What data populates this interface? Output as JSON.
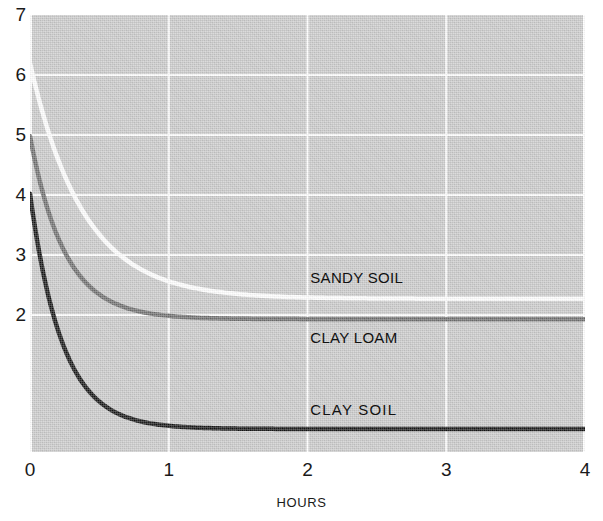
{
  "chart_data": {
    "type": "line",
    "title": "",
    "xlabel": "HOURS",
    "ylabel": "",
    "xlim": [
      0,
      4
    ],
    "ylim": [
      0,
      7
    ],
    "xticks": [
      "0",
      "1",
      "2",
      "3",
      "4"
    ],
    "yticks": [
      "7",
      "6",
      "5",
      "4",
      "3",
      "2"
    ],
    "grid": true,
    "grid_color": "#ffffff",
    "plot_background": "#c9c9c9",
    "legend_position": "inline-right-of-curves",
    "series": [
      {
        "name": "SANDY SOIL",
        "color": "#ffffff",
        "start_value": 6.2,
        "asymptote": 2.27,
        "decay_rate": 2.6,
        "label_x": 2.02,
        "label_y": 2.62,
        "x": [
          0.0,
          0.1,
          0.2,
          0.3,
          0.4,
          0.5,
          0.6,
          0.7,
          0.8,
          0.9,
          1.0,
          1.2,
          1.4,
          1.6,
          1.8,
          2.0,
          2.5,
          3.0,
          3.5,
          4.0
        ],
        "values": [
          6.2,
          5.27,
          4.55,
          3.99,
          3.56,
          3.23,
          2.97,
          2.78,
          2.63,
          2.51,
          2.42,
          2.33,
          2.29,
          2.28,
          2.27,
          2.27,
          2.27,
          2.27,
          2.27,
          2.27
        ]
      },
      {
        "name": "CLAY LOAM",
        "color": "#6d6d6d",
        "start_value": 4.98,
        "asymptote": 1.93,
        "decay_rate": 4.0,
        "label_x": 2.02,
        "label_y": 1.62,
        "x": [
          0.0,
          0.1,
          0.2,
          0.3,
          0.4,
          0.5,
          0.6,
          0.7,
          0.8,
          0.9,
          1.0,
          1.2,
          1.4,
          1.6,
          1.8,
          2.0,
          2.5,
          3.0,
          3.5,
          4.0
        ],
        "values": [
          4.98,
          3.97,
          3.3,
          2.85,
          2.55,
          2.34,
          2.21,
          2.11,
          2.05,
          2.01,
          1.99,
          1.96,
          1.95,
          1.94,
          1.94,
          1.94,
          1.93,
          1.93,
          1.93,
          1.93
        ]
      },
      {
        "name": "CLAY SOIL",
        "color": "#121212",
        "start_value": 4.02,
        "asymptote": 0.1,
        "decay_rate": 4.3,
        "label_x": 2.02,
        "label_y": 0.42,
        "x": [
          0.0,
          0.1,
          0.2,
          0.3,
          0.4,
          0.5,
          0.6,
          0.7,
          0.8,
          0.9,
          1.0,
          1.2,
          1.4,
          1.6,
          1.8,
          2.0,
          2.5,
          3.0,
          3.5,
          4.0
        ],
        "values": [
          4.02,
          2.65,
          1.76,
          1.18,
          0.8,
          0.55,
          0.39,
          0.28,
          0.22,
          0.17,
          0.15,
          0.12,
          0.11,
          0.1,
          0.1,
          0.1,
          0.1,
          0.1,
          0.1,
          0.1
        ]
      }
    ]
  }
}
